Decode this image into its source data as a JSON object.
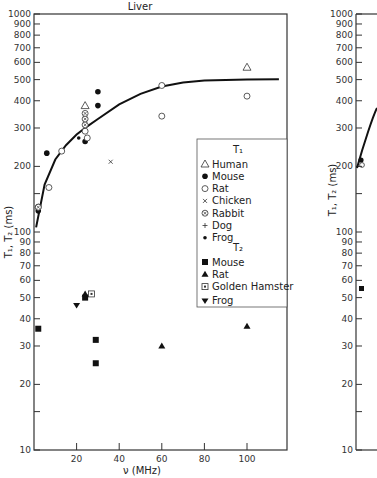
{
  "chart_data": [
    {
      "type": "scatter",
      "title": "Liver",
      "xlabel": "ν (MHz)",
      "ylabel": "T1, T2 (ms)",
      "xscale": "linear",
      "yscale": "log",
      "xlim": [
        0,
        117
      ],
      "ylim": [
        10,
        1000
      ],
      "x_ticks": [
        20,
        40,
        60,
        80,
        100
      ],
      "y_ticks": [
        10,
        20,
        30,
        40,
        50,
        60,
        70,
        80,
        90,
        100,
        200,
        300,
        400,
        500,
        600,
        700,
        800,
        900,
        1000
      ],
      "legend_position": "right-center",
      "legend": {
        "T1_header": "T1",
        "T1": [
          "Human",
          "Mouse",
          "Rat",
          "Chicken",
          "Rabbit",
          "Dog",
          "Frog"
        ],
        "T2_header": "T2",
        "T2": [
          "Mouse",
          "Rat",
          "Golden Hamster",
          "Frog"
        ]
      },
      "fit_curve": {
        "label": "T1 fit",
        "x": [
          1,
          5,
          10,
          15,
          20,
          25,
          30,
          40,
          50,
          60,
          70,
          80,
          100,
          115
        ],
        "y": [
          105,
          165,
          215,
          250,
          280,
          305,
          330,
          385,
          430,
          465,
          485,
          495,
          500,
          502
        ]
      },
      "series": [
        {
          "name": "T1 Human",
          "marker": "triangle-open",
          "points": [
            [
              24,
              380
            ],
            [
              100,
              570
            ]
          ]
        },
        {
          "name": "T1 Mouse",
          "marker": "circle-filled",
          "points": [
            [
              2,
              125
            ],
            [
              6,
              230
            ],
            [
              24,
              260
            ],
            [
              30,
              380
            ],
            [
              30,
              440
            ]
          ]
        },
        {
          "name": "T1 Rat",
          "marker": "circle-open",
          "points": [
            [
              2,
              130
            ],
            [
              7,
              160
            ],
            [
              13,
              235
            ],
            [
              24,
              290
            ],
            [
              25,
              270
            ],
            [
              60,
              470
            ],
            [
              60,
              340
            ],
            [
              100,
              420
            ]
          ]
        },
        {
          "name": "T1 Chicken",
          "marker": "x",
          "points": [
            [
              36,
              210
            ]
          ]
        },
        {
          "name": "T1 Rabbit",
          "marker": "circle-cross",
          "points": [
            [
              2,
              130
            ],
            [
              24,
              310
            ],
            [
              24,
              330
            ],
            [
              24,
              350
            ]
          ]
        },
        {
          "name": "T1 Frog",
          "marker": "dot-small",
          "points": [
            [
              21,
              270
            ]
          ]
        },
        {
          "name": "T2 Mouse",
          "marker": "square-filled",
          "points": [
            [
              2,
              36
            ],
            [
              24,
              50
            ],
            [
              29,
              32
            ],
            [
              29,
              25
            ]
          ]
        },
        {
          "name": "T2 Rat",
          "marker": "triangle-filled",
          "points": [
            [
              24,
              52
            ],
            [
              60,
              30
            ],
            [
              100,
              37
            ]
          ]
        },
        {
          "name": "T2 Golden Hamster",
          "marker": "square-dot",
          "points": [
            [
              27,
              52
            ]
          ]
        },
        {
          "name": "T2 Frog",
          "marker": "triangle-down-filled",
          "points": [
            [
              20,
              46
            ]
          ]
        }
      ]
    },
    {
      "type": "scatter",
      "title": "",
      "partial": true,
      "xlabel": "",
      "ylabel": "T1, T2 (ms)",
      "yscale": "log",
      "ylim": [
        10,
        1000
      ],
      "y_ticks": [
        10,
        20,
        30,
        40,
        50,
        60,
        70,
        80,
        90,
        100,
        200,
        300,
        400,
        500,
        600,
        700,
        800,
        900,
        1000
      ],
      "series": [
        {
          "name": "T1 Mouse",
          "marker": "circle-filled",
          "points": [
            [
              1,
              215
            ]
          ]
        },
        {
          "name": "T1 Rabbit",
          "marker": "circle-cross",
          "points": [
            [
              1,
              205
            ]
          ]
        },
        {
          "name": "T2 Mouse",
          "marker": "square-filled",
          "points": [
            [
              1,
              56
            ]
          ]
        }
      ]
    }
  ],
  "labels": {
    "title": "Liver",
    "xlabel": "ν (MHz)",
    "ylabel": "T₁, T₂ (ms)",
    "legend_t1": "T₁",
    "legend_t2": "T₂",
    "legend_items_t1": [
      "Human",
      "Mouse",
      "Rat",
      "Chicken",
      "Rabbit",
      "Dog",
      "Frog"
    ],
    "legend_items_t2": [
      "Mouse",
      "Rat",
      "Golden Hamster",
      "Frog"
    ]
  }
}
